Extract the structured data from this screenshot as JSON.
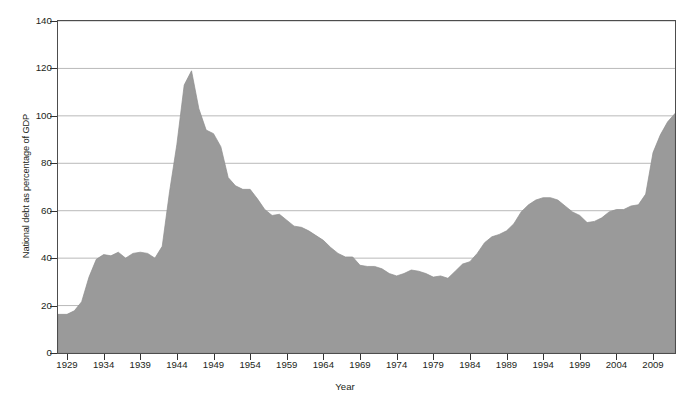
{
  "chart_data": {
    "type": "area",
    "title": "",
    "xlabel": "Year",
    "ylabel": "National debt as percentage of GDP",
    "xlim": [
      1929,
      2012
    ],
    "ylim": [
      0,
      140
    ],
    "ytick_labels": [
      "0",
      "20",
      "40",
      "60",
      "80",
      "100",
      "120",
      "140"
    ],
    "ytick_values": [
      0,
      20,
      40,
      60,
      80,
      100,
      120,
      140
    ],
    "xtick_labels": [
      "1929",
      "1934",
      "1939",
      "1944",
      "1949",
      "1954",
      "1959",
      "1964",
      "1969",
      "1974",
      "1979",
      "1984",
      "1989",
      "1994",
      "1999",
      "2004",
      "2009"
    ],
    "xtick_values": [
      1929,
      1934,
      1939,
      1944,
      1949,
      1954,
      1959,
      1964,
      1969,
      1974,
      1979,
      1984,
      1989,
      1994,
      1999,
      2004,
      2009
    ],
    "grid": true,
    "grid_axis": "y",
    "legend": false,
    "fill_color": "#9a9a9a",
    "line_color": "#8e8e8e",
    "axis_color": "#4d4d4d",
    "gridline_color": "#b9b9b9",
    "x": [
      1929,
      1930,
      1931,
      1932,
      1933,
      1934,
      1935,
      1936,
      1937,
      1938,
      1939,
      1940,
      1941,
      1942,
      1943,
      1944,
      1945,
      1946,
      1947,
      1948,
      1949,
      1950,
      1951,
      1952,
      1953,
      1954,
      1955,
      1956,
      1957,
      1958,
      1959,
      1960,
      1961,
      1962,
      1963,
      1964,
      1965,
      1966,
      1967,
      1968,
      1969,
      1970,
      1971,
      1972,
      1973,
      1974,
      1975,
      1976,
      1977,
      1978,
      1979,
      1980,
      1981,
      1982,
      1983,
      1984,
      1985,
      1986,
      1987,
      1988,
      1989,
      1990,
      1991,
      1992,
      1993,
      1994,
      1995,
      1996,
      1997,
      1998,
      1999,
      2000,
      2001,
      2002,
      2003,
      2004,
      2005,
      2006,
      2007,
      2008,
      2009,
      2010,
      2011,
      2012
    ],
    "values": [
      16.3,
      17.8,
      21.6,
      32.0,
      39.5,
      41.5,
      41.0,
      42.5,
      40.0,
      42.0,
      42.5,
      42.0,
      40.0,
      45.0,
      68.0,
      88.0,
      113.0,
      119.0,
      103.0,
      94.0,
      92.5,
      87.0,
      74.0,
      70.5,
      69.0,
      69.0,
      65.0,
      60.5,
      58.0,
      58.5,
      56.0,
      53.5,
      53.0,
      51.5,
      49.5,
      47.5,
      44.5,
      42.0,
      40.5,
      40.5,
      37.0,
      36.5,
      36.5,
      35.5,
      33.5,
      32.5,
      33.5,
      35.0,
      34.5,
      33.5,
      32.0,
      32.5,
      31.5,
      34.5,
      37.5,
      38.5,
      42.0,
      46.5,
      49.0,
      50.0,
      51.5,
      54.5,
      59.5,
      62.5,
      64.5,
      65.5,
      65.5,
      64.5,
      62.0,
      59.5,
      58.0,
      55.0,
      55.5,
      57.0,
      59.5,
      60.5,
      60.5,
      62.0,
      62.5,
      67.0,
      84.5,
      92.0,
      97.5,
      101.0
    ]
  }
}
